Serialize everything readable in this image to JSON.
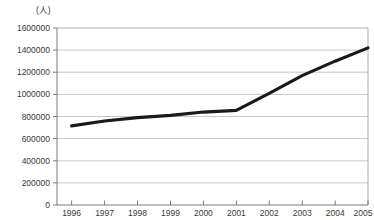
{
  "chart_data": {
    "type": "line",
    "title": "",
    "subtitle": "",
    "xlabel": "",
    "ylabel": "",
    "unit_label": "(人)",
    "categories": [
      "1996",
      "1997",
      "1998",
      "1999",
      "2000",
      "2001",
      "2002",
      "2003",
      "2004",
      "2005"
    ],
    "x": [
      1996,
      1997,
      1998,
      1999,
      2000,
      2001,
      2002,
      2003,
      2004,
      2005
    ],
    "values": [
      715000,
      760000,
      790000,
      810000,
      840000,
      855000,
      1010000,
      1170000,
      1300000,
      1420000
    ],
    "series": [
      {
        "name": "",
        "values": [
          715000,
          760000,
          790000,
          810000,
          840000,
          855000,
          1010000,
          1170000,
          1300000,
          1420000
        ],
        "color": "#1a1a1a"
      }
    ],
    "ylim": [
      0,
      1600000
    ],
    "ytick_values": [
      0,
      200000,
      400000,
      600000,
      800000,
      1000000,
      1200000,
      1400000,
      1600000
    ],
    "ytick_labels": [
      "0",
      "200000",
      "400000",
      "600000",
      "800000",
      "1000000",
      "1200000",
      "1400000",
      "1600000"
    ],
    "xtick_labels": [
      "1996",
      "1997",
      "1998",
      "1999",
      "2000",
      "2001",
      "2002",
      "2003",
      "2004",
      "2005"
    ],
    "grid": true,
    "grid_axis": "y",
    "legend": false,
    "legend_position": "none",
    "line_color": "#1a1a1a",
    "gridline_color": "#b9b9b9",
    "axis_color": "#6e6e6e",
    "background_color": "#ffffff"
  }
}
